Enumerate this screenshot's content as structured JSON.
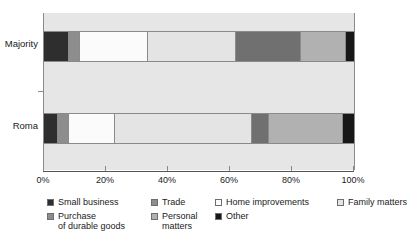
{
  "chart_data": {
    "type": "bar",
    "orientation": "horizontal",
    "stacked": true,
    "stack_total": 100,
    "title": "",
    "subtitle": "",
    "xlabel": "",
    "ylabel": "",
    "xlim": [
      0,
      100
    ],
    "xticks": [
      0,
      20,
      40,
      60,
      80,
      100
    ],
    "xticklabels": [
      "0%",
      "20%",
      "40%",
      "60%",
      "80%",
      "100%"
    ],
    "grid": false,
    "legend_position": "bottom",
    "categories": [
      "Majority",
      "Roma"
    ],
    "series": [
      {
        "name": "Small business",
        "color": "#2e2e2e",
        "values": [
          8.0,
          4.5
        ]
      },
      {
        "name": "Purchase of durable goods",
        "color": "#8d8d8d",
        "values": [
          3.5,
          3.5
        ]
      },
      {
        "name": "Trade",
        "color": "#fbfbfb",
        "values": [
          22.0,
          15.0
        ]
      },
      {
        "name": "Home improvements",
        "color": "#e4e4e4",
        "values": [
          28.5,
          44.0
        ]
      },
      {
        "name": "Personal matters",
        "color": "#707070",
        "values": [
          21.0,
          5.5
        ]
      },
      {
        "name": "Family matters",
        "color": "#b1b1b1",
        "values": [
          14.5,
          24.0
        ]
      },
      {
        "name": "Other",
        "color": "#171717",
        "values": [
          2.5,
          3.5
        ]
      }
    ]
  },
  "axis": {
    "y_labels": [
      "Majority",
      "Roma"
    ],
    "x_tick_labels": [
      "0%",
      "20%",
      "40%",
      "60%",
      "80%",
      "100%"
    ]
  },
  "legend": {
    "columns": [
      [
        {
          "label": "Small business",
          "color": "#2e2e2e"
        },
        {
          "label": "Purchase\nof durable goods",
          "color": "#8d8d8d"
        }
      ],
      [
        {
          "label": "Trade",
          "color": "#8d8d8d"
        },
        {
          "label": "Personal\nmatters",
          "color": "#b1b1b1"
        }
      ],
      [
        {
          "label": "Home improvements",
          "color": "#fbfbfb"
        },
        {
          "label": "Other",
          "color": "#171717"
        }
      ],
      [
        {
          "label": "Family matters",
          "color": "#e4e4e4"
        }
      ]
    ]
  }
}
